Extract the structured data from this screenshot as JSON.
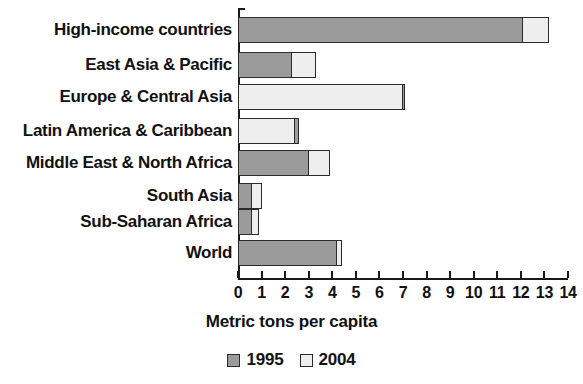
{
  "chart_data": {
    "type": "bar",
    "orientation": "horizontal",
    "title": "",
    "xlabel": "Metric tons per capita",
    "ylabel": "",
    "xlim": [
      0,
      14
    ],
    "xticks": [
      0,
      1,
      2,
      3,
      4,
      5,
      6,
      7,
      8,
      9,
      10,
      11,
      12,
      13,
      14
    ],
    "xtick_labels": [
      "0",
      "1",
      "2",
      "3",
      "4",
      "5",
      "6",
      "7",
      "8",
      "9",
      "10",
      "11",
      "12",
      "13",
      "14"
    ],
    "grid": false,
    "legend_position": "bottom",
    "categories": [
      "High-income countries",
      "East Asia & Pacific",
      "Europe & Central Asia",
      "Latin America & Caribbean",
      "Middle East & North Africa",
      "South Asia",
      "Sub-Saharan Africa",
      "World"
    ],
    "series": [
      {
        "name": "1995",
        "color": "#9b9b9b",
        "values": [
          12.1,
          2.3,
          7.1,
          2.6,
          3.0,
          0.6,
          0.6,
          4.2
        ]
      },
      {
        "name": "2004",
        "color": "#eeeeee",
        "values": [
          13.2,
          3.3,
          7.0,
          2.4,
          3.9,
          1.0,
          0.9,
          4.4
        ]
      }
    ]
  },
  "legend": {
    "items": [
      {
        "label": "1995",
        "swatch": "#9b9b9b"
      },
      {
        "label": "2004",
        "swatch": "#eeeeee"
      }
    ]
  }
}
